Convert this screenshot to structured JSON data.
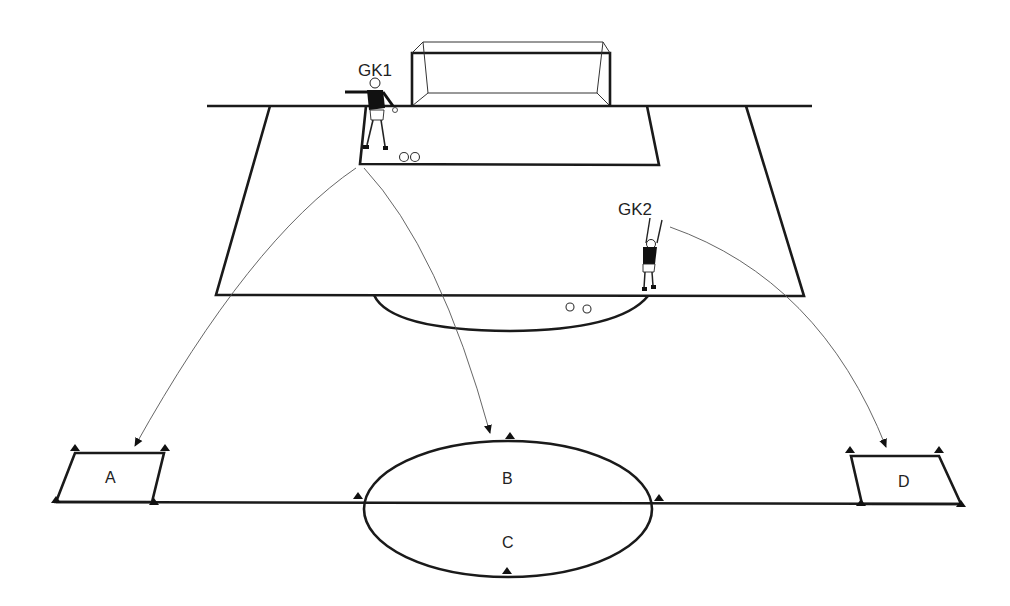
{
  "diagram": {
    "type": "soccer-goalkeeper-distribution-drill",
    "colors": {
      "lines": "#1a1a1a",
      "paths": "#555555",
      "background": "#ffffff"
    },
    "players": [
      {
        "id": "gk1",
        "label": "GK1",
        "position": "goal line near left post of six-yard box",
        "pose": "throwing"
      },
      {
        "id": "gk2",
        "label": "GK2",
        "position": "edge of penalty area, right side",
        "pose": "arms raised"
      }
    ],
    "balls": [
      {
        "location": "six-yard box near GK1",
        "count": 2
      },
      {
        "location": "penalty arc",
        "count": 2
      }
    ],
    "zones": [
      {
        "id": "A",
        "label": "A",
        "shape": "parallelogram",
        "position": "left"
      },
      {
        "id": "B",
        "label": "B",
        "shape": "half-ellipse (top)",
        "position": "center"
      },
      {
        "id": "C",
        "label": "C",
        "shape": "half-ellipse (bottom)",
        "position": "center"
      },
      {
        "id": "D",
        "label": "D",
        "shape": "parallelogram",
        "position": "right"
      }
    ],
    "passes": [
      {
        "from": "GK1",
        "to": "A"
      },
      {
        "from": "GK1",
        "to": "B"
      },
      {
        "from": "GK2",
        "to": "D"
      }
    ],
    "markers": {
      "icon": "cone-icon",
      "count": 14
    }
  }
}
